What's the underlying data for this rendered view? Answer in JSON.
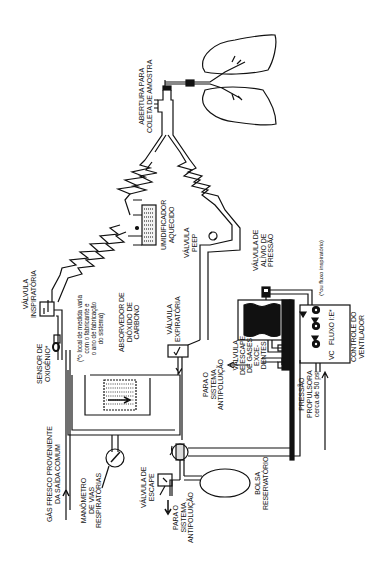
{
  "diagram": {
    "orientation": "rotated -90deg",
    "colors": {
      "line": "#111111",
      "background": "#ffffff"
    },
    "labels": {
      "sample_port": "ABERTURA PARA\nCOLETA DE AMOSTRA",
      "heated_humidifier": "UMIDIFICADOR\nAQUECIDO",
      "peep_valve": "VÁLVULA\nPEEP",
      "pressure_relief_valve": "VÁLVULA DE\nALÍVIO DE\nPRESSÃO",
      "inspiratory_flow_note": "(*ou fluxo inspiratório)",
      "inspiratory_valve": "VÁLVULA\nINSPIRATÓRIA",
      "oxygen_sensor": "SENSOR DE\nOXIGÊNIO*",
      "oxygen_sensor_note": "(*o local de medida varia\ncom o fabricante e\no ano de fabricação\ndo sistema)",
      "co2_absorber": "ABSORVEDOR DE\nDIÓXIDO DE\nCARBONO",
      "expiratory_valve": "VÁLVULA\nEXPIRATÓRIA",
      "to_scavenging_1": "PARA O\nSISTEMA\nANTIPOLUIÇÃO",
      "excess_gas_valve": "VÁLVULA\nDE ESCAPE\nDE GASES\nEXCE-\nDENTES",
      "ventilator_control": "CONTROLE DO\nVENTILADOR",
      "control_knobs": "VC   FLUXO I:E*",
      "drive_pressure": "PRESSÃO\nPROPULSORA\ncerca de 50 psi",
      "fresh_gas": "GÁS FRESCO PROVENIENTE\nDA SAÍDA COMUM",
      "airway_manometer": "MANÔMETRO\nDE VIAS\nRESPIRATÓRIAS",
      "pop_off_valve": "VÁLVULA DE\nESCAPE",
      "to_scavenging_2": "PARA O\nSISTEMA\nANTIPOLUIÇÃO",
      "reservoir_bag": "BOLSA\nRESERVATÓRIO"
    },
    "components": [
      "lungs-icon",
      "y-piece",
      "inspiratory-limb",
      "expiratory-limb",
      "humidifier-icon",
      "peep-valve-icon",
      "inspiratory-valve-icon",
      "oxygen-sensor-icon",
      "co2-absorber-icon",
      "expiratory-valve-icon",
      "bellows-icon",
      "pressure-relief-valve-icon",
      "ventilator-control-box",
      "manometer-icon",
      "selector-valve-icon",
      "apl-valve-icon",
      "reservoir-bag-icon"
    ]
  }
}
